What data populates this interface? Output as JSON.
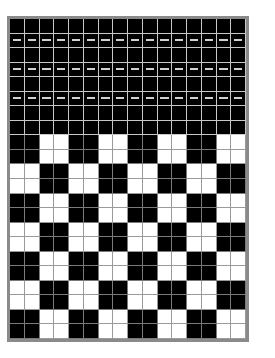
{
  "grid": {
    "columns": 16,
    "rows": 22,
    "solid_black_rows": 8,
    "dashed_rows": [
      1,
      3,
      5
    ],
    "checker_start_row": 8,
    "checker_block_size": 2,
    "colors": {
      "black": "#000000",
      "white": "#ffffff",
      "gridline": "#c8c8c8",
      "border": "#8a8a8a",
      "dash": "#d0d0d0"
    }
  }
}
